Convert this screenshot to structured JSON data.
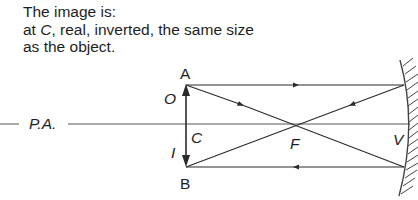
{
  "caption": {
    "line1": "The image is:",
    "line2_prefix": "at ",
    "line2_point": "C",
    "line2_rest": ", real, inverted, the same size",
    "line3": "as the object."
  },
  "labels": {
    "top_point": "A",
    "bottom_point": "B",
    "object": "O",
    "image": "I",
    "centre_of_curvature": "C",
    "focus": "F",
    "vertex": "V",
    "principal_axis": "P.A."
  },
  "colors": {
    "line": "#2a2a2a",
    "axis": "#555555",
    "background": "#ffffff"
  }
}
